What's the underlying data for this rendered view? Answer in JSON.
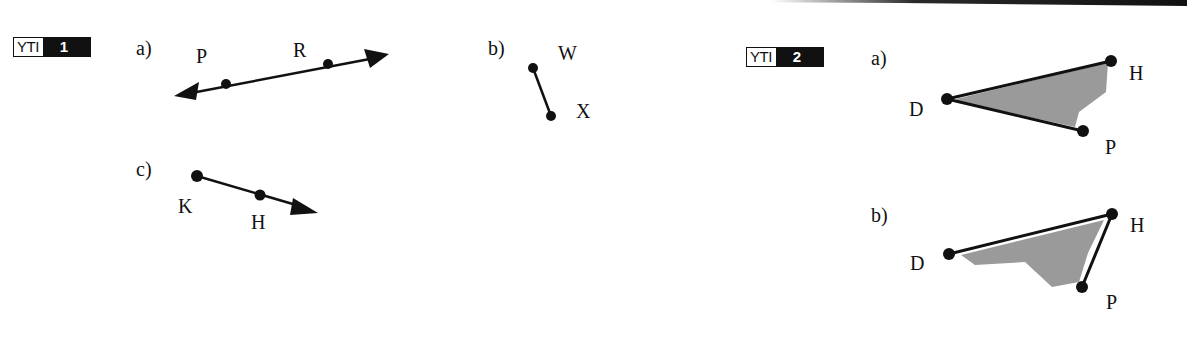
{
  "header_rule": {
    "color": "#111111"
  },
  "yti1": {
    "badge": {
      "label": "YTI",
      "number": "1"
    },
    "parts": [
      {
        "id": "a",
        "label": "a)",
        "figure": "line",
        "points": [
          "P",
          "R"
        ]
      },
      {
        "id": "b",
        "label": "b)",
        "figure": "segment",
        "points": [
          "W",
          "X"
        ]
      },
      {
        "id": "c",
        "label": "c)",
        "figure": "ray",
        "points": [
          "K",
          "H"
        ]
      }
    ]
  },
  "yti2": {
    "badge": {
      "label": "YTI",
      "number": "2"
    },
    "parts": [
      {
        "id": "a",
        "label": "a)",
        "figure": "angle",
        "vertex": "D",
        "points": [
          "D",
          "H",
          "P"
        ]
      },
      {
        "id": "b",
        "label": "b)",
        "figure": "angle",
        "vertex": "H",
        "points": [
          "D",
          "H",
          "P"
        ]
      }
    ]
  },
  "colors": {
    "ink": "#111111",
    "shade": "#9a9a9a",
    "badge_bg": "#111111",
    "badge_fg": "#ffffff"
  }
}
